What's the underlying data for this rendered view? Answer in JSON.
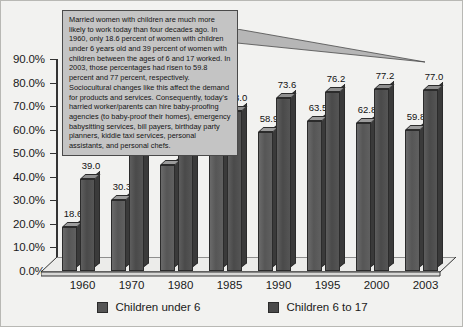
{
  "chart_data": {
    "type": "bar",
    "title": "",
    "subtitle": "",
    "xlabel": "",
    "ylabel": "",
    "ylim": [
      0,
      90
    ],
    "grid": false,
    "legend_position": "bottom",
    "categories": [
      "1960",
      "1970",
      "1980",
      "1985",
      "1990",
      "1995",
      "2000",
      "2003"
    ],
    "ytick_labels": [
      "0.0%",
      "10.0%",
      "20.0%",
      "30.0%",
      "40.0%",
      "50.0%",
      "60.0%",
      "70.0%",
      "80.0%",
      "90.0%"
    ],
    "ytick_values": [
      0,
      10,
      20,
      30,
      40,
      50,
      60,
      70,
      80,
      90
    ],
    "series": [
      {
        "name": "Children under 6",
        "color": "#555555",
        "values": [
          18.6,
          30.3,
          45.1,
          53.4,
          58.9,
          63.5,
          62.8,
          59.8
        ],
        "labels": [
          "18.6",
          "30.3",
          "45.1",
          "53.4",
          "58.9",
          "63.5",
          "62.8",
          "59.8"
        ]
      },
      {
        "name": "Children 6 to 17",
        "color": "#4a4a4a",
        "values": [
          39.0,
          49.2,
          62.0,
          68.0,
          73.6,
          76.2,
          77.2,
          77.0
        ],
        "labels": [
          "39.0",
          "49.2",
          "62.0",
          "68.0",
          "73.6",
          "76.2",
          "77.2",
          "77.0"
        ]
      }
    ],
    "annotations": [
      {
        "name": "callout",
        "text": "Married women with children are much more likely to work today than four decades ago. In 1960, only 18.6 percent of women with children under 6 years old and 39 percent of women with children between the ages of 6 and 17 worked. In 2003, those percentages had risen to 59.8 percent and 77 percent, respectively. Sociocultural changes like this affect the demand for products and services. Consequently, today's harried worker/parents can hire baby-proofing agencies (to baby-proof their homes), emergency babysitting services, bill payers, birthday party planners, kiddie taxi services, personal assistants, and personal chefs."
      }
    ]
  },
  "legend": {
    "items": [
      {
        "label": "Children under 6",
        "color": "#555555"
      },
      {
        "label": "Children 6 to 17",
        "color": "#4a4a4a"
      }
    ]
  }
}
